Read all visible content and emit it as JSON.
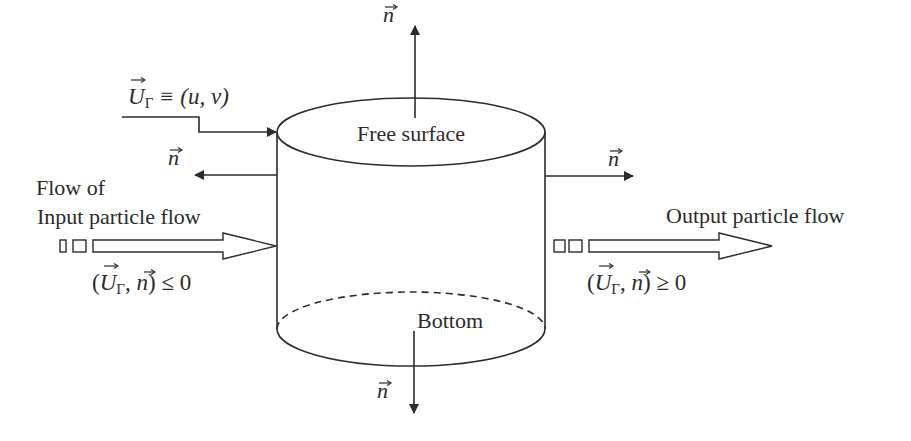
{
  "diagram": {
    "cylinder": {
      "top_label": "Free surface",
      "bottom_label": "Bottom"
    },
    "normals": {
      "top": "n",
      "left": "n",
      "right": "n",
      "bottom": "n"
    },
    "boundary_velocity": {
      "symbol": "U",
      "subscript": "Γ",
      "rest": " ≡ (u, v)"
    },
    "inflow": {
      "line1": "Flow of",
      "line2": "Input particle flow",
      "condition_open": "(",
      "condition_U": "U",
      "condition_sub": "Γ",
      "condition_comma": ", ",
      "condition_n": "n",
      "condition_close": ") ≤ 0"
    },
    "outflow": {
      "label": "Output particle flow",
      "condition_open": "(",
      "condition_U": "U",
      "condition_sub": "Γ",
      "condition_comma": ", ",
      "condition_n": "n",
      "condition_close": ") ≥ 0"
    },
    "colors": {
      "stroke": "#2b2b2b",
      "background": "#ffffff"
    }
  }
}
